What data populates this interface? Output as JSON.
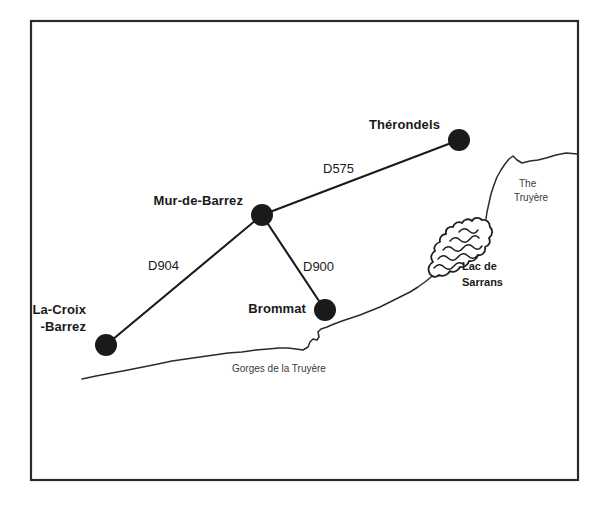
{
  "map": {
    "title": "Map of the Mur-de-Barrez region, Aveyron",
    "frame": {
      "x": 31,
      "y": 21,
      "width": 547,
      "height": 459
    },
    "colors": {
      "ink": "#1a1a1a",
      "frame": "#2b2b2b",
      "river": "#2b2b2b",
      "water_label": "#3a3a3a",
      "background": "#ffffff"
    },
    "towns": [
      {
        "id": "therondels",
        "label": "Thérondels",
        "cx": 459,
        "cy": 140,
        "r": 11,
        "label_x": 440,
        "label_y": 126,
        "anchor": "end"
      },
      {
        "id": "mur-de-barrez",
        "label": "Mur-de-Barrez",
        "cx": 262,
        "cy": 215,
        "r": 11,
        "label_x": 243,
        "label_y": 202,
        "anchor": "end"
      },
      {
        "id": "la-croix-barrez",
        "label": "La-Croix",
        "label2": "-Barrez",
        "cx": 106,
        "cy": 345,
        "r": 11,
        "label_x": 86,
        "label_y": 311,
        "anchor": "end"
      },
      {
        "id": "brommat",
        "label": "Brommat",
        "cx": 325,
        "cy": 310,
        "r": 11,
        "label_x": 306,
        "label_y": 310,
        "anchor": "end"
      }
    ],
    "roads": [
      {
        "id": "d575",
        "label": "D575",
        "from": "mur-de-barrez",
        "to": "therondels",
        "x1": 262,
        "y1": 215,
        "x2": 459,
        "y2": 140,
        "label_x": 323,
        "label_y": 170
      },
      {
        "id": "d904",
        "label": "D904",
        "from": "mur-de-barrez",
        "to": "la-croix-barrez",
        "x1": 262,
        "y1": 215,
        "x2": 106,
        "y2": 345,
        "label_x": 148,
        "label_y": 267
      },
      {
        "id": "d900",
        "label": "D900",
        "from": "mur-de-barrez",
        "to": "brommat",
        "x1": 262,
        "y1": 215,
        "x2": 325,
        "y2": 310,
        "label_x": 303,
        "label_y": 268
      }
    ],
    "water_features": [
      {
        "id": "the-truyere",
        "label_line1": "The",
        "label_line2": "Truyère",
        "label_x": 519,
        "label_y": 184,
        "style": "plain"
      },
      {
        "id": "lac-de-sarrans",
        "label_line1": "Lac de",
        "label_line2": "Sarrans",
        "label_x": 462,
        "label_y": 267,
        "style": "bold"
      },
      {
        "id": "gorges-de-la-truyere",
        "label_line1": "Gorges de la Truyère",
        "label_x": 232,
        "label_y": 369,
        "style": "plain"
      }
    ],
    "river_upper_path": "M 578 154 L 566 153 L 556 155 L 546 158 L 538 160 L 530 161 L 522 163 L 517 160 L 513 156 L 509 159 L 505 164 L 501 170 L 497 177 L 494 185 L 491 194 L 489 203 L 487 212 L 486 219",
    "river_lower_path": "M 82 379 L 96 376 L 112 373 L 128 370 L 143 367 L 158 364 L 172 361 L 186 359 L 200 357 L 214 355 L 228 353 L 242 352 L 256 350 L 268 349 L 279 348 L 288 348 L 296 349 L 303 350 L 308 347 L 310 342 L 313 339 L 317 340 L 319 337 L 318 332 L 321 329 L 327 327 L 334 324 L 342 321 L 351 318 L 360 315 L 370 311 L 380 307 L 390 302 L 400 297 L 410 292 L 418 287 L 425 282 L 431 277 L 435 273",
    "lake_outline_path": "M 430 274 C 427 269 429 264 433 262 C 430 258 431 253 435 251 C 433 247 436 243 440 242 C 439 238 442 234 446 234 C 445 229 449 226 453 227 C 454 223 458 221 462 223 C 464 219 469 218 472 221 C 474 217 479 217 482 220 C 486 219 490 222 490 227 C 493 230 493 235 489 238 C 491 242 489 246 485 247 C 486 252 482 256 478 255 C 477 259 473 262 469 261 C 468 265 464 268 460 267 C 458 271 454 273 450 271 C 448 275 443 277 439 275 C 436 278 432 277 430 274 Z",
    "lake_hatch_paths": [
      "M 434 268 q 5 -6 10 -1 q 5 5 10 -1 q 5 -6 10 -1",
      "M 438 259 q 5 -6 10 -1 q 5 5 10 -1 q 5 -6 10 -1 q 5 5 10 -1",
      "M 443 250 q 5 -6 10 -1 q 5 5 10 -1 q 5 -6 10 -1 q 5 5 9 -1",
      "M 450 241 q 5 -6 10 -1 q 5 5 10 -1 q 5 -6 9 -1",
      "M 459 232 q 5 -6 10 -1 q 5 5 9 -1"
    ]
  }
}
